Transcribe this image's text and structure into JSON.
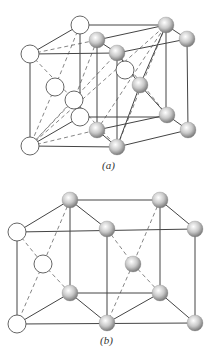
{
  "figures": [
    {
      "id": "a",
      "caption": "(a)",
      "caption_pos": [
        110,
        167
      ],
      "open_atoms": [
        [
          80,
          25
        ],
        [
          30,
          54
        ],
        [
          55,
          87
        ],
        [
          74,
          100
        ],
        [
          80,
          117
        ],
        [
          30,
          146
        ],
        [
          125,
          70
        ]
      ],
      "gray_atoms": [
        [
          97,
          40
        ],
        [
          117,
          53
        ],
        [
          166,
          25
        ],
        [
          187,
          39
        ],
        [
          140,
          85
        ],
        [
          167,
          115
        ],
        [
          188,
          130
        ],
        [
          97,
          130
        ],
        [
          117,
          147
        ]
      ],
      "solid_lines": [
        [
          [
            80,
            25
          ],
          [
            166,
            25
          ]
        ],
        [
          [
            30,
            54
          ],
          [
            117,
            53
          ]
        ],
        [
          [
            30,
            54
          ],
          [
            30,
            146
          ]
        ],
        [
          [
            30,
            146
          ],
          [
            117,
            147
          ]
        ],
        [
          [
            80,
            25
          ],
          [
            80,
            117
          ]
        ],
        [
          [
            80,
            117
          ],
          [
            166,
            117
          ]
        ],
        [
          [
            97,
            40
          ],
          [
            97,
            130
          ]
        ],
        [
          [
            117,
            53
          ],
          [
            117,
            147
          ]
        ],
        [
          [
            166,
            25
          ],
          [
            166,
            115
          ]
        ],
        [
          [
            187,
            39
          ],
          [
            188,
            130
          ]
        ],
        [
          [
            97,
            40
          ],
          [
            166,
            25
          ]
        ],
        [
          [
            117,
            53
          ],
          [
            187,
            39
          ]
        ],
        [
          [
            166,
            25
          ],
          [
            187,
            39
          ]
        ],
        [
          [
            97,
            40
          ],
          [
            117,
            53
          ]
        ],
        [
          [
            97,
            130
          ],
          [
            167,
            115
          ]
        ],
        [
          [
            117,
            147
          ],
          [
            188,
            130
          ]
        ],
        [
          [
            167,
            115
          ],
          [
            188,
            130
          ]
        ],
        [
          [
            97,
            130
          ],
          [
            117,
            147
          ]
        ],
        [
          [
            30,
            54
          ],
          [
            80,
            25
          ]
        ],
        [
          [
            30,
            146
          ],
          [
            80,
            117
          ]
        ],
        [
          [
            166,
            25
          ],
          [
            140,
            85
          ]
        ],
        [
          [
            140,
            85
          ],
          [
            167,
            115
          ]
        ],
        [
          [
            117,
            53
          ],
          [
            140,
            85
          ]
        ],
        [
          [
            140,
            85
          ],
          [
            117,
            147
          ]
        ]
      ],
      "dashed_lines": [
        [
          [
            30,
            54
          ],
          [
            97,
            40
          ]
        ],
        [
          [
            80,
            25
          ],
          [
            55,
            87
          ]
        ],
        [
          [
            55,
            87
          ],
          [
            30,
            146
          ]
        ],
        [
          [
            30,
            54
          ],
          [
            74,
            100
          ]
        ],
        [
          [
            74,
            100
          ],
          [
            117,
            147
          ]
        ],
        [
          [
            97,
            40
          ],
          [
            74,
            100
          ]
        ],
        [
          [
            74,
            100
          ],
          [
            30,
            146
          ]
        ],
        [
          [
            30,
            146
          ],
          [
            97,
            130
          ]
        ],
        [
          [
            30,
            146
          ],
          [
            117,
            53
          ]
        ],
        [
          [
            30,
            146
          ],
          [
            166,
            25
          ]
        ],
        [
          [
            117,
            147
          ],
          [
            166,
            25
          ]
        ],
        [
          [
            97,
            130
          ],
          [
            166,
            25
          ]
        ],
        [
          [
            117,
            53
          ],
          [
            167,
            115
          ]
        ]
      ]
    },
    {
      "id": "b",
      "caption": "(b)",
      "caption_pos": [
        108,
        342
      ],
      "open_atoms": [
        [
          17,
          232
        ],
        [
          43,
          264
        ],
        [
          17,
          324
        ]
      ],
      "gray_atoms": [
        [
          70,
          200
        ],
        [
          160,
          200
        ],
        [
          107,
          229
        ],
        [
          195,
          229
        ],
        [
          133,
          264
        ],
        [
          70,
          293
        ],
        [
          160,
          293
        ],
        [
          107,
          323
        ],
        [
          195,
          323
        ]
      ],
      "solid_lines": [
        [
          [
            70,
            200
          ],
          [
            160,
            200
          ]
        ],
        [
          [
            17,
            232
          ],
          [
            195,
            229
          ]
        ],
        [
          [
            17,
            232
          ],
          [
            17,
            324
          ]
        ],
        [
          [
            17,
            324
          ],
          [
            195,
            323
          ]
        ],
        [
          [
            70,
            200
          ],
          [
            70,
            293
          ]
        ],
        [
          [
            70,
            293
          ],
          [
            160,
            293
          ]
        ],
        [
          [
            107,
            229
          ],
          [
            107,
            323
          ]
        ],
        [
          [
            160,
            200
          ],
          [
            160,
            293
          ]
        ],
        [
          [
            195,
            229
          ],
          [
            195,
            323
          ]
        ],
        [
          [
            17,
            232
          ],
          [
            70,
            200
          ]
        ],
        [
          [
            70,
            200
          ],
          [
            107,
            229
          ]
        ],
        [
          [
            160,
            200
          ],
          [
            195,
            229
          ]
        ],
        [
          [
            17,
            324
          ],
          [
            70,
            293
          ]
        ],
        [
          [
            70,
            293
          ],
          [
            107,
            323
          ]
        ],
        [
          [
            160,
            293
          ],
          [
            195,
            323
          ]
        ],
        [
          [
            107,
            323
          ],
          [
            160,
            293
          ]
        ]
      ],
      "dashed_lines": [
        [
          [
            17,
            232
          ],
          [
            43,
            264
          ]
        ],
        [
          [
            43,
            264
          ],
          [
            70,
            293
          ]
        ],
        [
          [
            70,
            200
          ],
          [
            43,
            264
          ]
        ],
        [
          [
            43,
            264
          ],
          [
            17,
            324
          ]
        ],
        [
          [
            107,
            229
          ],
          [
            133,
            264
          ]
        ],
        [
          [
            133,
            264
          ],
          [
            160,
            293
          ]
        ],
        [
          [
            160,
            200
          ],
          [
            133,
            264
          ]
        ],
        [
          [
            133,
            264
          ],
          [
            107,
            323
          ]
        ]
      ]
    }
  ],
  "colors": {
    "line": "#444444",
    "open_fill": "#ffffff",
    "open_stroke": "#555555",
    "gray_light": "#f2f2f2",
    "gray_dark": "#8a8a8a"
  },
  "atom_radius": 8
}
